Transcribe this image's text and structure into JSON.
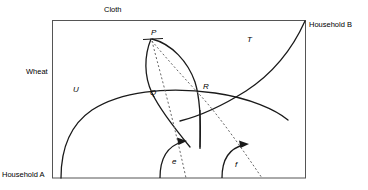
{
  "figure": {
    "type": "edgeworth-box-diagram",
    "axis_labels": {
      "top": "Cloth",
      "left": "Wheat"
    },
    "corner_labels": {
      "bottom_left": "Household A",
      "top_right": "Household B"
    },
    "curve_labels": {
      "u": "U",
      "t": "T"
    },
    "point_labels": {
      "p": "P",
      "q": "Q",
      "r": "R"
    },
    "arrow_labels": {
      "e": "e",
      "f": "f"
    },
    "colors": {
      "ink": "#1a1a1a",
      "box": "#555555",
      "dashed": "#666666",
      "background": "#ffffff"
    }
  }
}
